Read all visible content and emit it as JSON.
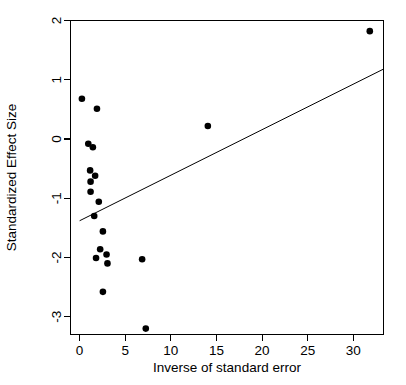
{
  "chart_data": {
    "type": "scatter",
    "title": "",
    "xlabel": "Inverse of standard error",
    "ylabel": "Standardized Effect Size",
    "xlim": [
      -1.0,
      33.3
    ],
    "ylim": [
      -3.3,
      2.0
    ],
    "xticks": [
      0,
      5,
      10,
      15,
      20,
      25,
      30
    ],
    "xtick_labels": [
      "0",
      "5",
      "10",
      "15",
      "20",
      "25",
      "30"
    ],
    "yticks": [
      2,
      1,
      0,
      -1,
      -2,
      -3
    ],
    "ytick_labels": [
      "2",
      "1",
      "0",
      "-1",
      "-2",
      "-3"
    ],
    "grid": false,
    "legend": false,
    "point_color": "#000000",
    "line_color": "#000000",
    "frame_color": "#000000",
    "background": "#ffffff",
    "points": [
      {
        "x": 0.25,
        "y": 0.68
      },
      {
        "x": 1.9,
        "y": 0.51
      },
      {
        "x": 0.95,
        "y": -0.08
      },
      {
        "x": 1.45,
        "y": -0.14
      },
      {
        "x": 1.15,
        "y": -0.53
      },
      {
        "x": 1.7,
        "y": -0.62
      },
      {
        "x": 1.2,
        "y": -0.72
      },
      {
        "x": 1.2,
        "y": -0.89
      },
      {
        "x": 2.1,
        "y": -1.06
      },
      {
        "x": 1.6,
        "y": -1.3
      },
      {
        "x": 2.55,
        "y": -1.56
      },
      {
        "x": 2.25,
        "y": -1.86
      },
      {
        "x": 1.8,
        "y": -2.01
      },
      {
        "x": 2.95,
        "y": -1.95
      },
      {
        "x": 3.05,
        "y": -2.1
      },
      {
        "x": 2.55,
        "y": -2.58
      },
      {
        "x": 6.85,
        "y": -2.03
      },
      {
        "x": 7.25,
        "y": -3.2
      },
      {
        "x": 14.05,
        "y": 0.22
      },
      {
        "x": 31.8,
        "y": 1.82
      }
    ],
    "trend_line": {
      "name": "regression-line",
      "x_start": 0.0,
      "y_start": -1.38,
      "x_end": 33.3,
      "y_end": 1.18
    }
  }
}
